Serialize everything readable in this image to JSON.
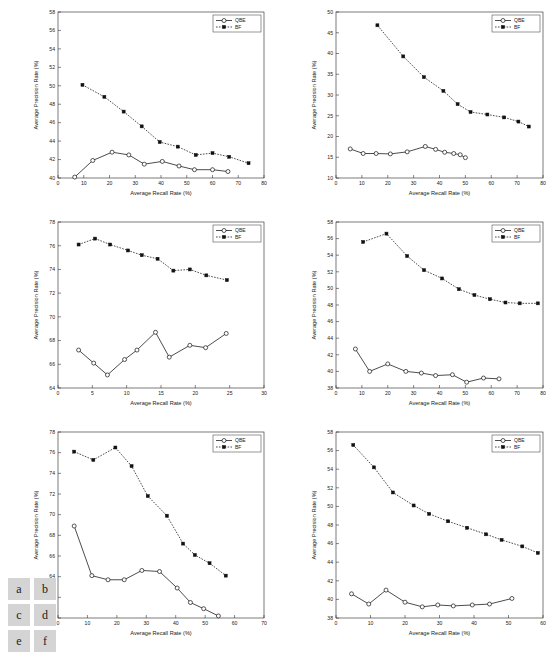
{
  "figure": {
    "panel_keys": [
      "a",
      "b",
      "c",
      "d",
      "e",
      "f"
    ],
    "legend": {
      "series1": "QBE",
      "series2": "BF"
    },
    "xlabel": "Average Recall Rate (%)",
    "ylabel": "Average Precision Rate (%)"
  },
  "chart_data": [
    {
      "key": "a",
      "type": "line",
      "title": "",
      "xlabel": "Average Recall Rate (%)",
      "ylabel": "Average Precision Rate (%)",
      "xlim": [
        0,
        80
      ],
      "ylim": [
        40,
        58
      ],
      "xticks": [
        0,
        10,
        20,
        30,
        40,
        50,
        60,
        70,
        80
      ],
      "yticks": [
        40,
        42,
        44,
        46,
        48,
        50,
        52,
        54,
        56,
        58
      ],
      "grid": false,
      "legend_position": "top-right",
      "series": [
        {
          "name": "QBE",
          "style": "solid-open-circle",
          "x": [
            6.5,
            13.5,
            21.0,
            27.5,
            33.5,
            40.5,
            47.0,
            53.0,
            60.0,
            66.0
          ],
          "y": [
            40.1,
            41.9,
            42.8,
            42.5,
            41.5,
            41.8,
            41.3,
            40.9,
            40.9,
            40.7
          ]
        },
        {
          "name": "BF",
          "style": "dotted-filled-square",
          "x": [
            9.5,
            18.0,
            25.5,
            32.5,
            39.5,
            46.5,
            53.5,
            60.0,
            66.5,
            74.0
          ],
          "y": [
            50.1,
            48.8,
            47.2,
            45.6,
            43.9,
            43.4,
            42.5,
            42.7,
            42.3,
            41.6
          ]
        }
      ]
    },
    {
      "key": "b",
      "type": "line",
      "title": "",
      "xlabel": "Average Recall Rate (%)",
      "ylabel": "Average Precision Rate (%)",
      "xlim": [
        0,
        80
      ],
      "ylim": [
        10,
        50
      ],
      "xticks": [
        0,
        10,
        20,
        30,
        40,
        50,
        60,
        70,
        80
      ],
      "yticks": [
        10,
        15,
        20,
        25,
        30,
        35,
        40,
        45,
        50
      ],
      "grid": false,
      "legend_position": "top-right",
      "series": [
        {
          "name": "QBE",
          "style": "solid-open-circle",
          "x": [
            5.5,
            10.5,
            15.5,
            21.0,
            27.5,
            34.5,
            38.5,
            42.0,
            45.5,
            48.0,
            50.0
          ],
          "y": [
            17.0,
            15.9,
            15.9,
            15.8,
            16.3,
            17.6,
            16.9,
            16.2,
            15.9,
            15.6,
            14.9
          ]
        },
        {
          "name": "BF",
          "style": "dotted-filled-square",
          "x": [
            16.0,
            26.0,
            34.0,
            41.5,
            47.0,
            52.0,
            58.5,
            65.0,
            70.5,
            74.5
          ],
          "y": [
            46.8,
            39.3,
            34.3,
            31.0,
            27.8,
            25.9,
            25.3,
            24.6,
            23.6,
            22.4
          ]
        }
      ]
    },
    {
      "key": "c",
      "type": "line",
      "title": "",
      "xlabel": "Average Recall Rate (%)",
      "ylabel": "Average Precision Rate (%)",
      "xlim": [
        0,
        30
      ],
      "ylim": [
        64,
        78
      ],
      "xticks": [
        0,
        5,
        10,
        15,
        20,
        25,
        30
      ],
      "yticks": [
        64,
        66,
        68,
        70,
        72,
        74,
        76,
        78
      ],
      "grid": false,
      "legend_position": "top-right",
      "series": [
        {
          "name": "QBE",
          "style": "solid-open-circle",
          "x": [
            3.0,
            5.2,
            7.2,
            9.7,
            11.5,
            14.2,
            16.2,
            19.2,
            21.5,
            24.5
          ],
          "y": [
            67.2,
            66.1,
            65.1,
            66.4,
            67.2,
            68.7,
            66.6,
            67.6,
            67.4,
            68.6
          ]
        },
        {
          "name": "BF",
          "style": "dotted-filled-square",
          "x": [
            3.0,
            5.4,
            7.6,
            10.2,
            12.2,
            14.5,
            16.8,
            19.2,
            21.6,
            24.6
          ],
          "y": [
            76.1,
            76.6,
            76.1,
            75.6,
            75.2,
            74.9,
            73.9,
            74.0,
            73.5,
            73.1
          ]
        }
      ]
    },
    {
      "key": "d",
      "type": "line",
      "title": "",
      "xlabel": "Average Recall Rate (%)",
      "ylabel": "Average Precision Rate (%)",
      "xlim": [
        0,
        80
      ],
      "ylim": [
        38,
        58
      ],
      "xticks": [
        0,
        10,
        20,
        30,
        40,
        50,
        60,
        70,
        80
      ],
      "yticks": [
        38,
        40,
        42,
        44,
        46,
        48,
        50,
        52,
        54,
        56,
        58
      ],
      "grid": false,
      "legend_position": "top-right",
      "series": [
        {
          "name": "QBE",
          "style": "solid-open-circle",
          "x": [
            7.5,
            13.0,
            20.0,
            27.0,
            33.0,
            38.5,
            45.0,
            50.5,
            57.0,
            63.0
          ],
          "y": [
            42.7,
            40.0,
            40.9,
            40.0,
            39.8,
            39.5,
            39.6,
            38.7,
            39.2,
            39.1
          ]
        },
        {
          "name": "BF",
          "style": "dotted-filled-square",
          "x": [
            10.5,
            19.5,
            27.5,
            34.0,
            41.0,
            47.5,
            53.5,
            59.5,
            65.5,
            71.0,
            78.0
          ],
          "y": [
            55.6,
            56.6,
            53.9,
            52.2,
            51.2,
            49.9,
            49.2,
            48.7,
            48.3,
            48.2,
            48.2
          ]
        }
      ]
    },
    {
      "key": "e",
      "type": "line",
      "title": "",
      "xlabel": "Average Recall Rate (%)",
      "ylabel": "Average Precision Rate (%)",
      "xlim": [
        0,
        70
      ],
      "ylim": [
        60,
        78
      ],
      "xticks": [
        0,
        10,
        20,
        30,
        40,
        50,
        60,
        70
      ],
      "yticks": [
        60,
        62,
        64,
        66,
        68,
        70,
        72,
        74,
        76,
        78
      ],
      "grid": false,
      "legend_position": "top-right",
      "series": [
        {
          "name": "QBE",
          "style": "solid-open-circle",
          "x": [
            5.5,
            11.5,
            17.0,
            22.5,
            28.5,
            34.5,
            40.5,
            45.0,
            49.5,
            54.5
          ],
          "y": [
            68.9,
            64.1,
            63.7,
            63.7,
            64.6,
            64.5,
            62.9,
            61.5,
            60.9,
            60.2
          ]
        },
        {
          "name": "BF",
          "style": "dotted-filled-square",
          "x": [
            5.5,
            12.0,
            19.5,
            25.0,
            30.5,
            37.0,
            42.5,
            46.5,
            51.5,
            57.0
          ],
          "y": [
            76.1,
            75.3,
            76.5,
            74.7,
            71.8,
            69.9,
            67.2,
            66.1,
            65.3,
            64.1
          ]
        }
      ]
    },
    {
      "key": "f",
      "type": "line",
      "title": "",
      "xlabel": "Average Recall Rate (%)",
      "ylabel": "Average Precision Rate (%)",
      "xlim": [
        0,
        60
      ],
      "ylim": [
        38,
        58
      ],
      "xticks": [
        0,
        10,
        20,
        30,
        40,
        50,
        60
      ],
      "yticks": [
        38,
        40,
        42,
        44,
        46,
        48,
        50,
        52,
        54,
        56,
        58
      ],
      "grid": false,
      "legend_position": "top-right",
      "series": [
        {
          "name": "QBE",
          "style": "solid-open-circle",
          "x": [
            4.5,
            9.5,
            14.5,
            20.0,
            25.0,
            29.5,
            34.0,
            39.5,
            44.5,
            51.0
          ],
          "y": [
            40.6,
            39.5,
            41.0,
            39.7,
            39.2,
            39.4,
            39.3,
            39.4,
            39.5,
            40.1
          ]
        },
        {
          "name": "BF",
          "style": "dotted-filled-square",
          "x": [
            5.0,
            11.0,
            16.5,
            22.5,
            27.0,
            32.5,
            38.0,
            43.5,
            48.0,
            54.0,
            58.5
          ],
          "y": [
            56.6,
            54.2,
            51.5,
            50.1,
            49.2,
            48.4,
            47.7,
            47.0,
            46.4,
            45.7,
            45.0
          ]
        }
      ]
    }
  ]
}
